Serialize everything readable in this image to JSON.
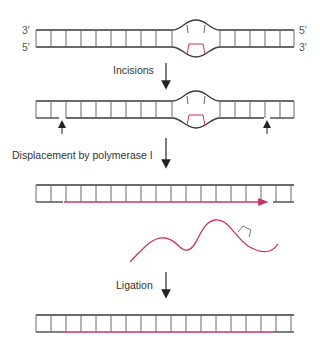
{
  "colors": {
    "strand": "#3a3a3a",
    "rung": "#6a6a6a",
    "new_strand": "#cc3366",
    "arrow": "#222222"
  },
  "stage1": {
    "top_left_end": "3′",
    "bottom_left_end": "5′",
    "top_right_end": "5′",
    "bottom_right_end": "3′"
  },
  "steps": [
    {
      "label": "Incisions"
    },
    {
      "label": "Displacement by polymerase I"
    },
    {
      "label": "Ligation"
    }
  ],
  "diagram": {
    "stages": [
      "Damaged duplex with distorted bulge (lesion in bottom strand)",
      "Incisions on either side of lesion",
      "Displacement by polymerase I (new strand synthesized, damaged oligonucleotide released)",
      "Ligation (repaired duplex)"
    ]
  }
}
